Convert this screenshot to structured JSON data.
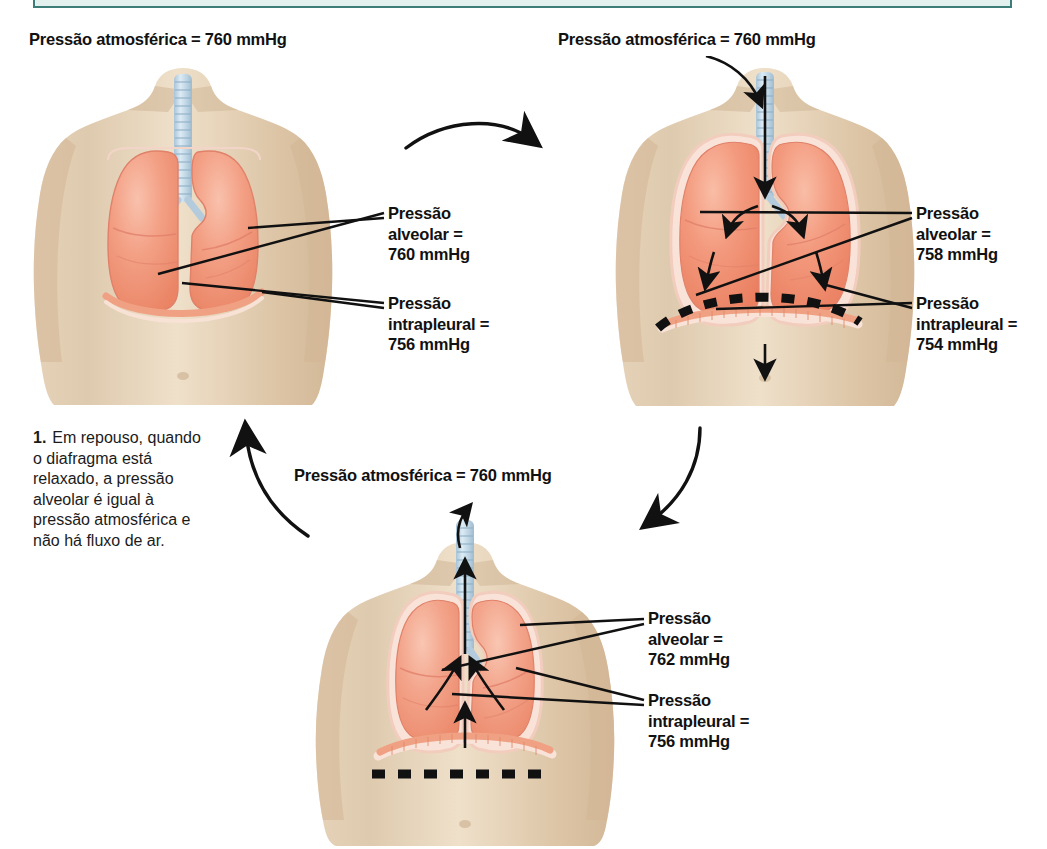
{
  "figure": {
    "kind": "respiratory-pressure-cycle-diagram",
    "language": "pt-BR",
    "colors": {
      "lung": "#f1937b",
      "lung_light": "#f6b39d",
      "pleura": "#f7ddd2",
      "skin": "#ddc3a4",
      "skin_light": "#ecd9c2",
      "trachea": "#c5d8e6",
      "diaphragm": "#f0a183",
      "line": "#111111",
      "teal_border": "#3d7d78",
      "teal_fill": "#e2f0ee"
    }
  },
  "topbar": {
    "label": ""
  },
  "panels": [
    {
      "id": "rest",
      "title": "Pressão atmosférica = 760 mmHg",
      "alveolar_label": "Pressão\nalveolar =\n760 mmHg",
      "intrapleural_label": "Pressão\nintrapleural =\n756 mmHg",
      "alveolar_value": 760,
      "intrapleural_value": 756,
      "atmospheric_value": 760,
      "state": "repouso",
      "diaphragm": "relaxado",
      "airflow": "nenhum"
    },
    {
      "id": "inspiracao",
      "title": "Pressão atmosférica = 760 mmHg",
      "alveolar_label": "Pressão\nalveolar =\n758 mmHg",
      "intrapleural_label": "Pressão\nintrapleural =\n754 mmHg",
      "alveolar_value": 758,
      "intrapleural_value": 754,
      "atmospheric_value": 760,
      "state": "inspiração",
      "diaphragm": "contraído / desce",
      "airflow": "entrada de ar"
    },
    {
      "id": "expiracao",
      "title": "Pressão atmosférica = 760 mmHg",
      "alveolar_label": "Pressão\nalveolar =\n762 mmHg",
      "intrapleural_label": "Pressão\nintrapleural =\n756 mmHg",
      "alveolar_value": 762,
      "intrapleural_value": 756,
      "atmospheric_value": 760,
      "state": "expiração",
      "diaphragm": "relaxa / sobe",
      "airflow": "saída de ar"
    }
  ],
  "steps": [
    {
      "number": "1.",
      "text": "Em repouso, quando o diafragma está relaxado, a pressão alveolar é igual à pressão atmosférica e não há fluxo de ar."
    }
  ],
  "units": "mmHg"
}
